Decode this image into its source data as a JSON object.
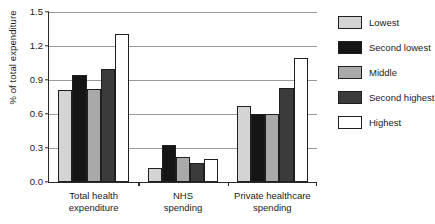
{
  "chart_data": {
    "type": "bar",
    "title": "",
    "subtitle": "",
    "xlabel": "",
    "ylabel": "% of total expenditure",
    "ylim": [
      0,
      1.5
    ],
    "yticks": [
      "0.0",
      "0.3",
      "0.6",
      "0.9",
      "1.2",
      "1.5"
    ],
    "ytick_values": [
      0.0,
      0.3,
      0.6,
      0.9,
      1.2,
      1.5
    ],
    "grid": true,
    "legend_position": "right",
    "categories": [
      "Total health expenditure",
      "NHS spending",
      "Private healthcare spending"
    ],
    "category_lines": [
      [
        "Total health",
        "expenditure"
      ],
      [
        "NHS",
        "spending"
      ],
      [
        "Private healthcare",
        "spending"
      ]
    ],
    "series": [
      {
        "name": "Lowest",
        "color": "#d4d4d4",
        "values": [
          0.81,
          0.12,
          0.67
        ]
      },
      {
        "name": "Second lowest",
        "color": "#151515",
        "values": [
          0.94,
          0.33,
          0.6
        ]
      },
      {
        "name": "Middle",
        "color": "#a9a9a9",
        "values": [
          0.82,
          0.22,
          0.6
        ]
      },
      {
        "name": "Second highest",
        "color": "#3b3b3b",
        "values": [
          1.0,
          0.17,
          0.83
        ]
      },
      {
        "name": "Highest",
        "color": "#ffffff",
        "values": [
          1.31,
          0.2,
          1.09
        ]
      }
    ]
  },
  "legend": {
    "items": [
      {
        "label": "Lowest",
        "color": "#d4d4d4"
      },
      {
        "label": "Second lowest",
        "color": "#151515"
      },
      {
        "label": "Middle",
        "color": "#a9a9a9"
      },
      {
        "label": "Second highest",
        "color": "#3b3b3b"
      },
      {
        "label": "Highest",
        "color": "#ffffff"
      }
    ]
  },
  "colors": {
    "axis": "#2a2a2a",
    "gridline": "#9a9a9a",
    "bar_outline": "#1f1f1f",
    "background": "#ffffff",
    "text": "#1a1a1a"
  }
}
